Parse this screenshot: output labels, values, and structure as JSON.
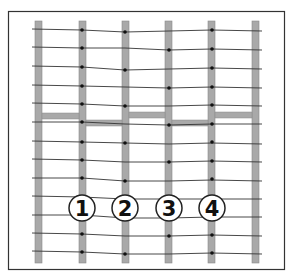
{
  "diagram": {
    "title": "",
    "labels": [
      "1",
      "2",
      "3",
      "4"
    ],
    "colors": {
      "post": "#a9a9a9",
      "post_stroke": "#8a8a8a",
      "wire": "#333333",
      "dot": "#111111",
      "frame": "#333333",
      "label_circle": "#ffffff"
    }
  }
}
